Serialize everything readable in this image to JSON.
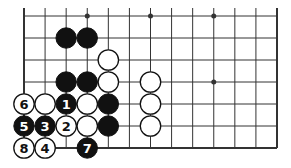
{
  "diagram": {
    "type": "go-board-fragment",
    "columns": 13,
    "rows": 7,
    "open_edges": [
      "top"
    ],
    "closed_edges": [
      "left",
      "right",
      "bottom"
    ],
    "star_points": [
      {
        "col": 3,
        "row": 0
      },
      {
        "col": 6,
        "row": 0
      },
      {
        "col": 9,
        "row": 0
      },
      {
        "col": 9,
        "row": 3
      }
    ],
    "stones": [
      {
        "col": 2,
        "row": 1,
        "color": "black",
        "label": ""
      },
      {
        "col": 3,
        "row": 1,
        "color": "black",
        "label": ""
      },
      {
        "col": 4,
        "row": 2,
        "color": "white",
        "label": ""
      },
      {
        "col": 2,
        "row": 3,
        "color": "black",
        "label": ""
      },
      {
        "col": 3,
        "row": 3,
        "color": "black",
        "label": ""
      },
      {
        "col": 4,
        "row": 3,
        "color": "white",
        "label": ""
      },
      {
        "col": 6,
        "row": 3,
        "color": "white",
        "label": ""
      },
      {
        "col": 0,
        "row": 4,
        "color": "white",
        "label": "6"
      },
      {
        "col": 1,
        "row": 4,
        "color": "white",
        "label": ""
      },
      {
        "col": 2,
        "row": 4,
        "color": "black",
        "label": "1"
      },
      {
        "col": 3,
        "row": 4,
        "color": "white",
        "label": ""
      },
      {
        "col": 4,
        "row": 4,
        "color": "black",
        "label": ""
      },
      {
        "col": 6,
        "row": 4,
        "color": "white",
        "label": ""
      },
      {
        "col": 0,
        "row": 5,
        "color": "black",
        "label": "5"
      },
      {
        "col": 1,
        "row": 5,
        "color": "black",
        "label": "3"
      },
      {
        "col": 2,
        "row": 5,
        "color": "white",
        "label": "2"
      },
      {
        "col": 3,
        "row": 5,
        "color": "white",
        "label": ""
      },
      {
        "col": 4,
        "row": 5,
        "color": "black",
        "label": ""
      },
      {
        "col": 6,
        "row": 5,
        "color": "white",
        "label": ""
      },
      {
        "col": 0,
        "row": 6,
        "color": "white",
        "label": "8"
      },
      {
        "col": 1,
        "row": 6,
        "color": "white",
        "label": "4"
      },
      {
        "col": 3,
        "row": 6,
        "color": "black",
        "label": "7"
      }
    ],
    "colors": {
      "line": "#333333",
      "black_stone": "#111111",
      "white_stone": "#ffffff",
      "background": "#ffffff"
    }
  }
}
